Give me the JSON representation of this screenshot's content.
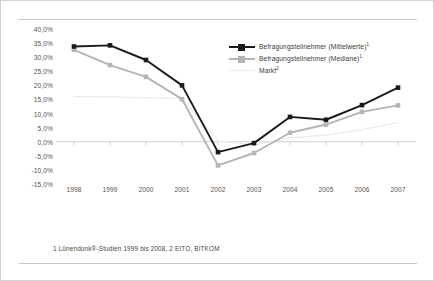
{
  "chart_data": {
    "type": "line",
    "title": "",
    "xlabel": "",
    "ylabel": "",
    "ylim": [
      -15,
      40
    ],
    "ytick_step": 5,
    "grid": false,
    "legend_position": "top-right",
    "categories": [
      "1998",
      "1999",
      "2000",
      "2001",
      "2002",
      "2003",
      "2004",
      "2005",
      "2006",
      "2007"
    ],
    "ytick_labels": [
      "40,0%",
      "35,0%",
      "30,0%",
      "25,0%",
      "20,0%",
      "15,0%",
      "10,0%",
      "5,0%",
      "0,0%",
      "-5,0%",
      "-10,0%",
      "-15,0%"
    ],
    "ytick_values": [
      40,
      35,
      30,
      25,
      20,
      15,
      10,
      5,
      0,
      -5,
      -10,
      -15
    ],
    "series": [
      {
        "name": "Befragungsteilnehmer (Mittelwerte)",
        "footnote_ref": "1",
        "color": "#1a1a1a",
        "marker": "square",
        "values": [
          33.8,
          34.2,
          29.0,
          20.0,
          -3.7,
          -0.5,
          8.8,
          7.8,
          13.0,
          19.2
        ]
      },
      {
        "name": "Befragungsteilnehmer (Mediane)",
        "footnote_ref": "1",
        "color": "#b5b5b5",
        "marker": "square",
        "values": [
          32.6,
          27.2,
          23.0,
          15.1,
          -8.4,
          -4.0,
          3.2,
          6.1,
          10.6,
          12.9
        ]
      },
      {
        "name": "Markt",
        "footnote_ref": "2",
        "color": "#ededed",
        "marker": "none",
        "values": [
          16.0,
          15.9,
          15.6,
          15.4,
          0.3,
          -1.2,
          1.4,
          2.4,
          4.3,
          6.8
        ]
      }
    ]
  },
  "legend": {
    "items": [
      {
        "label": "Befragungsteilnehmer (Mittelwerte)",
        "sup": "1"
      },
      {
        "label": "Befragungsteilnehmer (Mediane)",
        "sup": "1"
      },
      {
        "label": "Markt",
        "sup": "2"
      }
    ]
  },
  "footnote": {
    "text": "1 Lünendonk®-Studien 1999 bis 2008,  2 EITO, BITKOM"
  },
  "colors": {
    "series_mean": "#1a1a1a",
    "series_median": "#b5b5b5",
    "series_market": "#ededed",
    "axis": "#c4c4c4",
    "text": "#59544f",
    "frame": "#d2d2d2"
  }
}
